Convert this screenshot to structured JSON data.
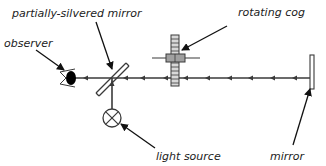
{
  "labels": {
    "partial_mirror": "partially-silvered mirror",
    "observer": "observer",
    "cog": "rotating cog",
    "light_source": "light source",
    "mirror": "mirror"
  },
  "colors": {
    "line": "#3a3a3a",
    "text": "#222222",
    "background": "#ffffff",
    "cog_fill": "#d8d8d8",
    "hub_fill": "#a0a0a0",
    "eye_fill": "#000000"
  }
}
